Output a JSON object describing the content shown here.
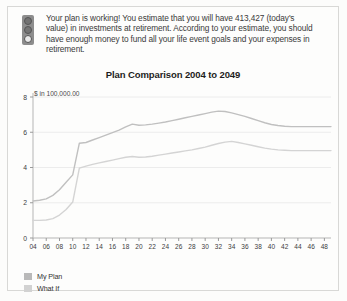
{
  "alert": {
    "icon": "traffic-light-icon",
    "message": "Your plan is working! You estimate that you will have 413,427 (today's value) in investments at retirement. According to your estimate, you should have enough money to fund all your life event goals and your expenses in retirement.",
    "estimated_retirement_investments": "413,427"
  },
  "legend": {
    "items": [
      {
        "label": "My Plan",
        "color": "#b9b9b9"
      },
      {
        "label": "What If",
        "color": "#d2d2d2"
      }
    ]
  },
  "chart_data": {
    "type": "line",
    "title": "Plan Comparison 2004 to 2049",
    "ylabel": "$ in 100,000.00",
    "xlabel": "",
    "grid": true,
    "legend_position": "bottom-left",
    "ylim": [
      0,
      8
    ],
    "yticks": [
      0,
      2,
      4,
      6,
      8
    ],
    "ytick_labels": [
      "0",
      "2",
      "4",
      "6",
      "8"
    ],
    "xlim": [
      4,
      49
    ],
    "xticks": [
      4,
      6,
      8,
      10,
      12,
      14,
      16,
      18,
      20,
      22,
      24,
      26,
      28,
      30,
      32,
      34,
      36,
      38,
      40,
      42,
      44,
      46,
      48
    ],
    "xtick_labels": [
      "04",
      "06",
      "08",
      "10",
      "12",
      "14",
      "16",
      "18",
      "20",
      "22",
      "24",
      "26",
      "28",
      "30",
      "32",
      "34",
      "36",
      "38",
      "40",
      "42",
      "44",
      "46",
      "48"
    ],
    "x": [
      4,
      5,
      6,
      7,
      8,
      9,
      10,
      11,
      12,
      13,
      14,
      15,
      16,
      17,
      18,
      19,
      20,
      21,
      22,
      23,
      24,
      25,
      26,
      27,
      28,
      29,
      30,
      31,
      32,
      33,
      34,
      35,
      36,
      37,
      38,
      39,
      40,
      41,
      42,
      43,
      44,
      45,
      46,
      47,
      48,
      49
    ],
    "series": [
      {
        "name": "My Plan",
        "color": "#c0c0c0",
        "values": [
          2.1,
          2.14,
          2.22,
          2.42,
          2.74,
          3.16,
          3.58,
          5.38,
          5.42,
          5.56,
          5.7,
          5.84,
          5.98,
          6.12,
          6.3,
          6.46,
          6.4,
          6.42,
          6.46,
          6.52,
          6.58,
          6.66,
          6.74,
          6.82,
          6.9,
          6.98,
          7.06,
          7.14,
          7.2,
          7.18,
          7.1,
          7.0,
          6.9,
          6.78,
          6.66,
          6.54,
          6.44,
          6.38,
          6.34,
          6.32,
          6.32,
          6.32,
          6.32,
          6.32,
          6.32,
          6.32
        ]
      },
      {
        "name": "What If",
        "color": "#d4d4d4",
        "values": [
          1.0,
          1.0,
          1.02,
          1.1,
          1.3,
          1.62,
          2.04,
          3.96,
          4.08,
          4.18,
          4.26,
          4.34,
          4.42,
          4.5,
          4.58,
          4.62,
          4.58,
          4.6,
          4.64,
          4.7,
          4.76,
          4.82,
          4.88,
          4.94,
          5.0,
          5.08,
          5.16,
          5.26,
          5.36,
          5.44,
          5.48,
          5.42,
          5.34,
          5.26,
          5.18,
          5.1,
          5.04,
          5.0,
          4.98,
          4.96,
          4.96,
          4.96,
          4.96,
          4.96,
          4.96,
          4.96
        ]
      }
    ]
  }
}
